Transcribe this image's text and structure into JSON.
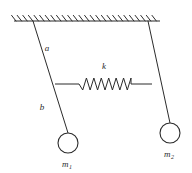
{
  "figure": {
    "background_color": "#ffffff",
    "stroke_color": "#2b2b2b"
  },
  "ceiling": {
    "name": "fixed support",
    "x_start": 14,
    "x_end": 160,
    "y": 21,
    "hatch_count": 26,
    "hatch_length": 7
  },
  "pendulums": [
    {
      "id": "left",
      "pivot": {
        "x": 33,
        "y": 21
      },
      "bob": {
        "cx": 68,
        "cy": 143,
        "r": 10
      },
      "mass_label": "m",
      "mass_subscript": "1",
      "mass_label_x": 62,
      "mass_label_y": 167,
      "segments": [
        {
          "label": "a",
          "label_x": 47,
          "label_y": 51
        },
        {
          "label": "b",
          "label_x": 42,
          "label_y": 110
        }
      ]
    },
    {
      "id": "right",
      "pivot": {
        "x": 148,
        "y": 21
      },
      "bob": {
        "cx": 170,
        "cy": 133,
        "r": 10
      },
      "mass_label": "m",
      "mass_subscript": "2",
      "mass_label_x": 164,
      "mass_label_y": 157,
      "segments": []
    }
  ],
  "spring": {
    "label": "k",
    "label_x": 104,
    "label_y": 69,
    "y": 84,
    "left_attach_x": 55,
    "right_attach_x": 152,
    "coil_start_x": 79,
    "coil_end_x": 131,
    "coil_count": 7,
    "amplitude": 6
  },
  "labels": {
    "segment_a": "a",
    "segment_b": "b",
    "spring_constant": "k",
    "mass_one": "m",
    "mass_one_sub": "1",
    "mass_two": "m",
    "mass_two_sub": "2"
  }
}
